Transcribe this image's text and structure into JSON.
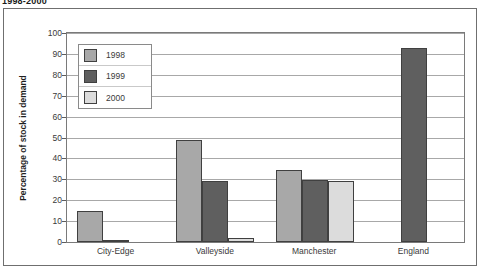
{
  "chart_data": {
    "type": "bar",
    "title": "1998-2000",
    "xlabel": "",
    "ylabel": "Percentage of stock in demand",
    "ylim": [
      0,
      100
    ],
    "yticks": [
      0,
      10,
      20,
      30,
      40,
      50,
      60,
      70,
      80,
      90,
      100
    ],
    "grid": true,
    "legend_position": "top-left inside plot",
    "categories": [
      "City-Edge",
      "Valleyside",
      "Manchester",
      "England"
    ],
    "series": [
      {
        "name": "1998",
        "color": "#a8a8a8",
        "values": [
          15,
          49,
          34.5,
          null
        ]
      },
      {
        "name": "1999",
        "color": "#5f5f5f",
        "values": [
          1,
          29,
          29.5,
          93
        ]
      },
      {
        "name": "2000",
        "color": "#dcdcdc",
        "values": [
          null,
          2,
          29,
          null
        ]
      }
    ]
  }
}
